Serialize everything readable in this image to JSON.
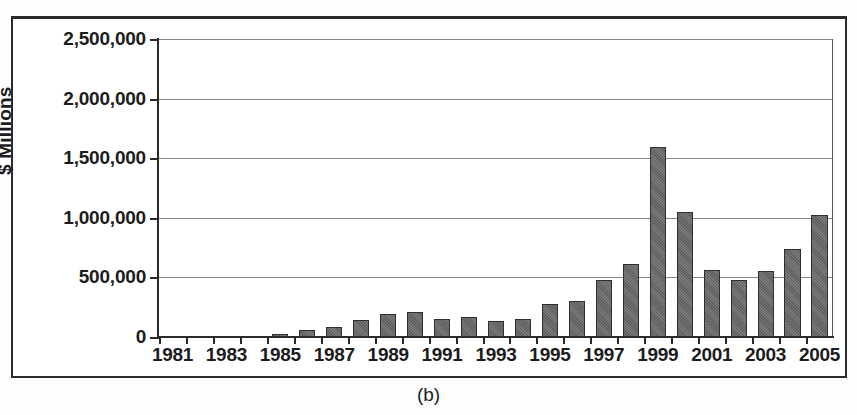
{
  "figure": {
    "caption": "(b)"
  },
  "chart_data": {
    "type": "bar",
    "title": "",
    "subtitle": "",
    "xlabel": "",
    "ylabel": "$ Millions",
    "ylim": [
      0,
      2500000
    ],
    "xlim_categories": [
      "1981",
      "2005"
    ],
    "grid": true,
    "legend": "none",
    "y_ticks": [
      0,
      500000,
      1000000,
      1500000,
      2000000,
      2500000
    ],
    "y_tick_labels": [
      "0",
      "500,000",
      "1,000,000",
      "1,500,000",
      "2,000,000",
      "2,500,000"
    ],
    "x_tick_labels": [
      "1981",
      "1983",
      "1985",
      "1987",
      "1989",
      "1991",
      "1993",
      "1995",
      "1997",
      "1999",
      "2001",
      "2003",
      "2005"
    ],
    "categories": [
      "1981",
      "1982",
      "1983",
      "1984",
      "1985",
      "1986",
      "1987",
      "1988",
      "1989",
      "1990",
      "1991",
      "1992",
      "1993",
      "1994",
      "1995",
      "1996",
      "1997",
      "1998",
      "1999",
      "2000",
      "2001",
      "2002",
      "2003",
      "2004",
      "2005"
    ],
    "values": [
      0,
      0,
      0,
      0,
      25000,
      55000,
      80000,
      140000,
      190000,
      210000,
      155000,
      170000,
      135000,
      150000,
      280000,
      305000,
      480000,
      610000,
      1595000,
      1050000,
      560000,
      475000,
      550000,
      735000,
      1020000
    ],
    "bar_color": "#6b6b6b",
    "bar_edge_color": "#2f2f2f",
    "axis_color": "#2b2b2b",
    "gridline_color": "#868686",
    "background_color": "#ffffff"
  }
}
